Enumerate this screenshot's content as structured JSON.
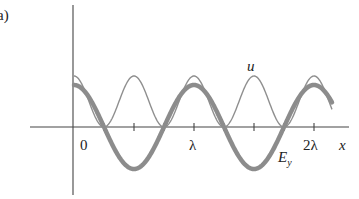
{
  "panel_label": "a)",
  "chart_data": {
    "type": "line",
    "title": "",
    "xlabel": "x",
    "ylabel": "",
    "x_ticks": [
      "0",
      "λ",
      "2λ"
    ],
    "x_tick_positions_lambda": [
      0,
      0.25,
      0.5,
      0.75,
      1.0,
      1.25,
      1.5,
      1.75,
      2.0
    ],
    "xlim_lambda": [
      0,
      2.25
    ],
    "grid": false,
    "legend": "inline labels",
    "series": [
      {
        "name": "E_y",
        "label": "E",
        "label_sub": "y",
        "style": "thick gray",
        "color": "#8a8a8a",
        "formula": "cos(2πx/λ)",
        "x_lambda": [
          0,
          0.25,
          0.5,
          0.75,
          1.0,
          1.25,
          1.5,
          1.75,
          2.0,
          2.15
        ],
        "values": [
          1,
          0,
          -1,
          0,
          1,
          0,
          -1,
          0,
          1,
          0.81
        ]
      },
      {
        "name": "u",
        "label": "u",
        "style": "thin gray",
        "color": "#8a8a8a",
        "formula": "cos²(2πx/λ)",
        "x_lambda": [
          0,
          0.25,
          0.5,
          0.75,
          1.0,
          1.25,
          1.5,
          1.75,
          2.0,
          2.15
        ],
        "values": [
          1,
          0,
          1,
          0,
          1,
          0,
          1,
          0,
          1,
          0.66
        ]
      }
    ]
  }
}
